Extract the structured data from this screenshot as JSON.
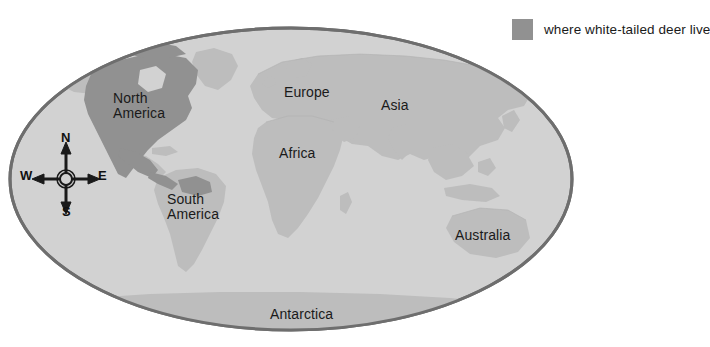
{
  "figure": {
    "title": "",
    "background_color": "#ffffff"
  },
  "legend": {
    "swatch_color": "#919191",
    "label": "where white-tailed deer live"
  },
  "map": {
    "projection": "oval world map",
    "ocean_color": "#d2d2d2",
    "land_color": "#bdbdbd",
    "highlight_color": "#919191",
    "outline_color": "#6e6e6e",
    "continent_labels": [
      {
        "id": "north-america",
        "text": "North\nAmerica",
        "line1": "North",
        "line2": "America"
      },
      {
        "id": "south-america",
        "text": "South\nAmerica",
        "line1": "South",
        "line2": "America"
      },
      {
        "id": "europe",
        "text": "Europe"
      },
      {
        "id": "asia",
        "text": "Asia"
      },
      {
        "id": "africa",
        "text": "Africa"
      },
      {
        "id": "australia",
        "text": "Australia"
      },
      {
        "id": "antarctica",
        "text": "Antarctica"
      }
    ],
    "highlighted_regions": [
      "North America"
    ]
  },
  "compass": {
    "north": "N",
    "south": "S",
    "east": "E",
    "west": "W"
  }
}
